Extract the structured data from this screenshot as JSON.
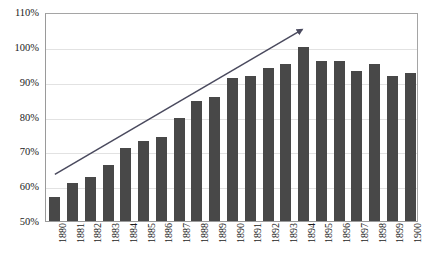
{
  "chart_data": {
    "type": "bar",
    "title": "",
    "subtitle": "",
    "xlabel": "",
    "ylabel": "",
    "categories": [
      "1880",
      "1881",
      "1882",
      "1883",
      "1884",
      "1885",
      "1886",
      "1887",
      "1888",
      "1889",
      "1890",
      "1891",
      "1892",
      "1893",
      "1894",
      "1895",
      "1896",
      "1897",
      "1898",
      "1899",
      "1900"
    ],
    "values": [
      57,
      61,
      62.5,
      66,
      71,
      73,
      74,
      79.5,
      84.5,
      85.5,
      91,
      91.5,
      94,
      95,
      100,
      96,
      96,
      93,
      95,
      91.5,
      92.5
    ],
    "value_format": "percent",
    "ylim": [
      50,
      110
    ],
    "ytick_step": 10,
    "ytick_labels": [
      "50%",
      "60%",
      "70%",
      "80%",
      "90%",
      "100%",
      "110%"
    ],
    "ytick_values": [
      50,
      60,
      70,
      80,
      90,
      100,
      110
    ],
    "grid": true,
    "grid_axis": "y",
    "legend": false,
    "legend_position": "none",
    "bar_color": "#484848",
    "grid_color": "#e2e2e2",
    "axis_color": "#9a9a9a",
    "plot_background": "#ffffff",
    "xtick_rotation": -90,
    "annotations": [
      {
        "name": "trend-arrow",
        "type": "arrow",
        "color": "#4a4a5e",
        "start": {
          "x_category": "1880",
          "y_value": 63.5
        },
        "end": {
          "x_category": "1894",
          "y_value": 105.5
        },
        "arrowhead": "end"
      }
    ]
  }
}
